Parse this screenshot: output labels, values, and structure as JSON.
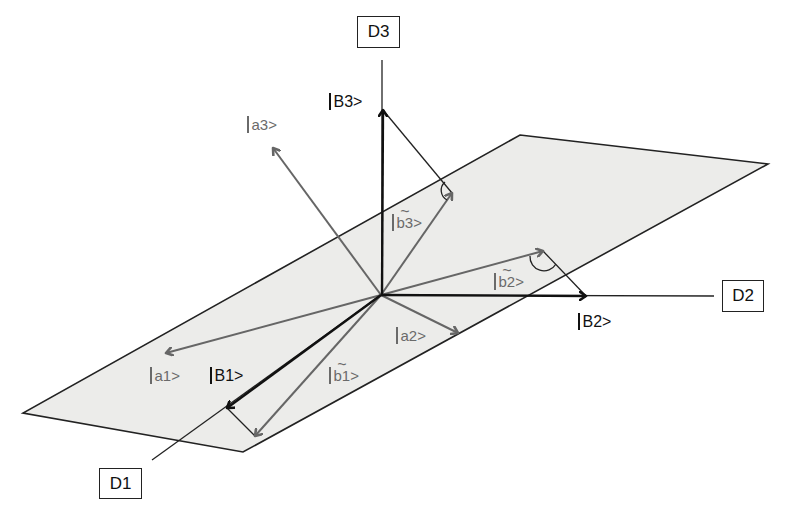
{
  "diagram": {
    "title": "",
    "colors": {
      "plane_fill": "#ececea",
      "plane_edge": "#222222",
      "basis_vector": "#111111",
      "state_vector": "#666666",
      "background": "#ffffff"
    },
    "origin": [
      381,
      295
    ],
    "axes": [
      {
        "id": "D1",
        "label": "D1"
      },
      {
        "id": "D2",
        "label": "D2"
      },
      {
        "id": "D3",
        "label": "D3"
      }
    ],
    "basis_vectors": [
      {
        "id": "B1",
        "label": "B1>",
        "tip": [
          227,
          408
        ]
      },
      {
        "id": "B2",
        "label": "B2>",
        "tip": [
          586,
          296
        ]
      },
      {
        "id": "B3",
        "label": "B3>",
        "tip": [
          383,
          110
        ]
      }
    ],
    "a_vectors": [
      {
        "id": "a1",
        "label": "a1>",
        "tip": [
          166,
          353
        ]
      },
      {
        "id": "a2",
        "label": "a2>",
        "tip": [
          458,
          333
        ]
      },
      {
        "id": "a3",
        "label": "a3>",
        "tip": [
          273,
          148
        ]
      }
    ],
    "b_tilde_vectors": [
      {
        "id": "b1",
        "label": "b1",
        "suffix": ">",
        "tip": [
          255,
          436
        ]
      },
      {
        "id": "b2",
        "label": "b2",
        "suffix": ">",
        "tip": [
          543,
          251
        ]
      },
      {
        "id": "b3",
        "label": "b3",
        "suffix": ">",
        "tip": [
          452,
          193
        ]
      }
    ],
    "plane": {
      "corners": [
        [
          520,
          135
        ],
        [
          768,
          164
        ],
        [
          243,
          452
        ],
        [
          23,
          413
        ]
      ]
    },
    "tilde_char": "~"
  }
}
